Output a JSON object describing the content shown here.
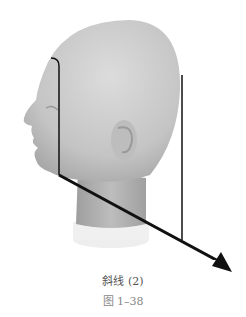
{
  "figure": {
    "annotation_lines": "black section lines with arrow",
    "line_color": "#111111",
    "head_color": "#c9c9c9"
  },
  "caption": {
    "title": "斜线 (2)",
    "figure_number": "图 1–38"
  }
}
